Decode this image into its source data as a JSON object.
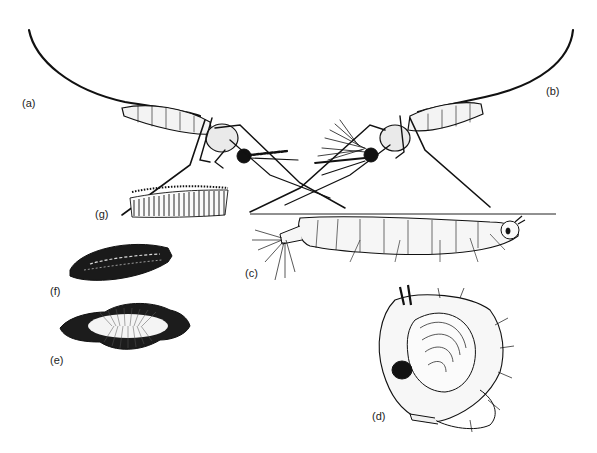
{
  "figure": {
    "background": "#ffffff",
    "ink_color": "#111111",
    "water_line_color": "#222222",
    "labels": [
      {
        "id": "a",
        "text": "(a)",
        "x": 22,
        "y": 98,
        "depicts": "adult mosquito resting (left, facing right)"
      },
      {
        "id": "b",
        "text": "(b)",
        "x": 546,
        "y": 86,
        "depicts": "adult mosquito resting (right, facing left, plumose antennae)"
      },
      {
        "id": "c",
        "text": "(c)",
        "x": 245,
        "y": 268,
        "depicts": "larva hanging at water surface"
      },
      {
        "id": "d",
        "text": "(d)",
        "x": 372,
        "y": 411,
        "depicts": "comma-shaped pupa"
      },
      {
        "id": "e",
        "text": "(e)",
        "x": 50,
        "y": 355,
        "depicts": "egg with lateral floats"
      },
      {
        "id": "f",
        "text": "(f)",
        "x": 50,
        "y": 286,
        "depicts": "single egg, dorsal view"
      },
      {
        "id": "g",
        "text": "(g)",
        "x": 95,
        "y": 209,
        "depicts": "egg raft"
      }
    ]
  }
}
